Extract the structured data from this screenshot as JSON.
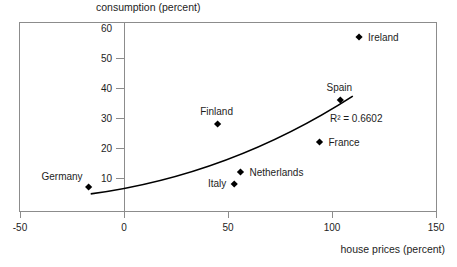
{
  "colors": {
    "background": "#ffffff",
    "frame": "#8c8c8c",
    "tick": "#8c8c8c",
    "text": "#1d1d1d",
    "marker": "#000000",
    "trendline": "#000000"
  },
  "chart_data": {
    "type": "scatter",
    "title": "",
    "ylabel": "consumption (percent)",
    "xlabel": "house prices (percent)",
    "xlim": [
      -50,
      150
    ],
    "ylim": [
      0,
      60
    ],
    "grid": false,
    "legend": "none",
    "x_ticks": [
      -50,
      0,
      50,
      100,
      150
    ],
    "y_ticks": [
      60,
      50,
      40,
      30,
      20,
      10
    ],
    "y_tick_marks": [
      50,
      40,
      30,
      20,
      10
    ],
    "points": [
      {
        "label": "Germany",
        "x": -17,
        "y": 7,
        "label_position": "above-left"
      },
      {
        "label": "Italy",
        "x": 53,
        "y": 8,
        "label_position": "left"
      },
      {
        "label": "Netherlands",
        "x": 56,
        "y": 12,
        "label_position": "right"
      },
      {
        "label": "Finland",
        "x": 45,
        "y": 28,
        "label_position": "above"
      },
      {
        "label": "France",
        "x": 94,
        "y": 22,
        "label_position": "right"
      },
      {
        "label": "Spain",
        "x": 104,
        "y": 36,
        "label_position": "above"
      },
      {
        "label": "Ireland",
        "x": 113,
        "y": 57,
        "label_position": "right"
      }
    ],
    "trendline": {
      "shape": "quadratic-bezier",
      "p0": {
        "x": -16,
        "y": 4.7
      },
      "control": {
        "x": 51,
        "y": 11
      },
      "p1": {
        "x": 110,
        "y": 37.3
      }
    },
    "annotation": {
      "text": "R² = 0.6602",
      "r_squared": 0.6602,
      "x": 99,
      "y": 30
    }
  }
}
